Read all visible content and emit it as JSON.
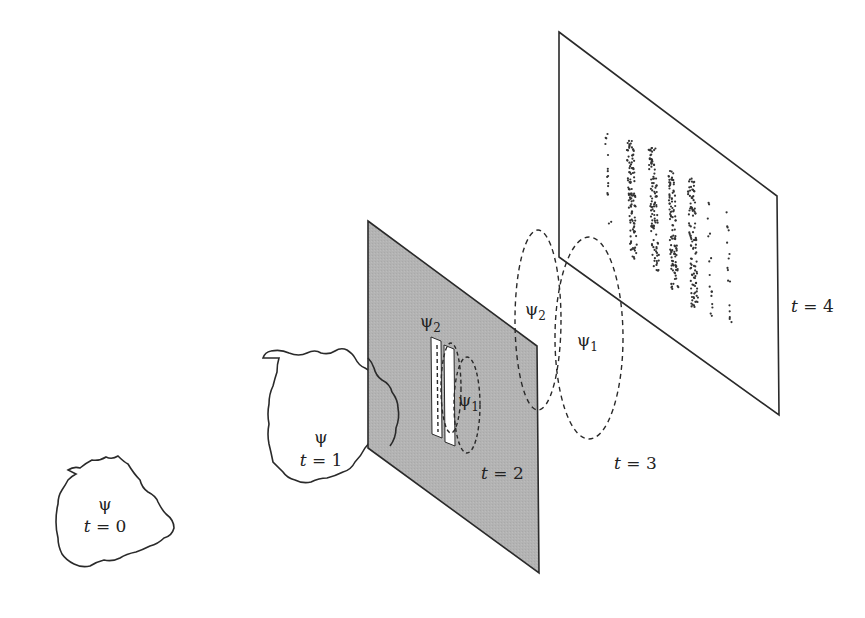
{
  "diagram": {
    "colors": {
      "line": "#2a2a2a",
      "slit_screen_fill": "#b3b3b3",
      "detector_fill": "#ffffff",
      "slit_fill": "#ffffff",
      "dots": "#333333"
    },
    "stages": [
      {
        "id": "t0",
        "psi_label": "ψ",
        "time_label": "t = 0",
        "t_var": "t",
        "t_val": "= 0"
      },
      {
        "id": "t1",
        "psi_label": "ψ",
        "time_label": "t = 1",
        "t_var": "t",
        "t_val": "= 1"
      },
      {
        "id": "t2",
        "time_label": "t = 2",
        "t_var": "t",
        "t_val": "= 2",
        "slit_labels": {
          "psi2": {
            "base": "ψ",
            "sub": "2"
          },
          "psi1": {
            "base": "ψ",
            "sub": "1"
          }
        }
      },
      {
        "id": "t3",
        "time_label": "t = 3",
        "t_var": "t",
        "t_val": "= 3",
        "wave_labels": {
          "psi2": {
            "base": "ψ",
            "sub": "2"
          },
          "psi1": {
            "base": "ψ",
            "sub": "1"
          }
        }
      },
      {
        "id": "t4",
        "time_label": "t = 4",
        "t_var": "t",
        "t_val": "= 4"
      }
    ],
    "interference_bands": [
      {
        "x": 606,
        "y_top": 126,
        "y_bot": 228,
        "density": "sparse"
      },
      {
        "x": 630,
        "y_top": 140,
        "y_bot": 262,
        "density": "dense"
      },
      {
        "x": 652,
        "y_top": 148,
        "y_bot": 275,
        "density": "dense"
      },
      {
        "x": 671,
        "y_top": 168,
        "y_bot": 290,
        "density": "dense"
      },
      {
        "x": 691,
        "y_top": 178,
        "y_bot": 308,
        "density": "dense"
      },
      {
        "x": 708,
        "y_top": 202,
        "y_bot": 318,
        "density": "sparse"
      },
      {
        "x": 727,
        "y_top": 210,
        "y_bot": 330,
        "density": "sparse"
      }
    ]
  }
}
